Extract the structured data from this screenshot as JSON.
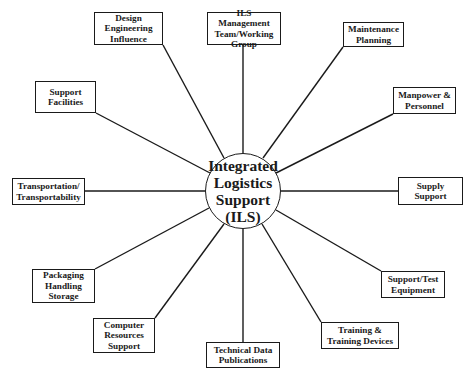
{
  "diagram": {
    "type": "hub-and-spoke",
    "center": {
      "label": "Integrated\nLogistics\nSupport\n(ILS)"
    },
    "nodes": [
      {
        "id": "design",
        "label": "Design\nEngineering\nInfluence"
      },
      {
        "id": "ils-mgmt",
        "label": "ILS Management\nTeam/Working\nGroup"
      },
      {
        "id": "maintenance",
        "label": "Maintenance\nPlanning"
      },
      {
        "id": "manpower",
        "label": "Manpower &\nPersonnel"
      },
      {
        "id": "supply",
        "label": "Supply\nSupport"
      },
      {
        "id": "support-test",
        "label": "Support/Test\nEquipment"
      },
      {
        "id": "training",
        "label": "Training &\nTraining Devices"
      },
      {
        "id": "technical-data",
        "label": "Technical Data\nPublications"
      },
      {
        "id": "computer",
        "label": "Computer\nResources\nSupport"
      },
      {
        "id": "packaging",
        "label": "Packaging\nHandling\nStorage"
      },
      {
        "id": "transportation",
        "label": "Transportation/\nTransportability"
      },
      {
        "id": "facilities",
        "label": "Support\nFacilities"
      }
    ],
    "colors": {
      "line": "#1a1a1a",
      "background": "#ffffff"
    }
  }
}
